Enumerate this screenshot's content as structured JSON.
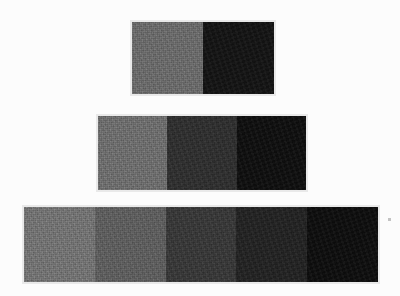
{
  "canvas": {
    "width": 400,
    "height": 296,
    "background": "#fcfcfc",
    "title": "Grayscale block pyramid"
  },
  "style": {
    "border_color": "#e9e9e9",
    "border_width": 2,
    "texture": "grainy-noise"
  },
  "chart_data": {
    "type": "heatmap",
    "subtitle": "",
    "xlabel": "",
    "ylabel": "",
    "grid": false,
    "legend": "none",
    "rows": [
      {
        "index": 0,
        "name": "top-row",
        "cell_count": 2,
        "x": 130,
        "y": 20,
        "width": 146,
        "height": 76,
        "cells": [
          {
            "index": 0,
            "color": "#6b6b6b",
            "gray_value": 107
          },
          {
            "index": 1,
            "color": "#131313",
            "gray_value": 19
          }
        ]
      },
      {
        "index": 1,
        "name": "middle-row",
        "cell_count": 3,
        "x": 96,
        "y": 114,
        "width": 212,
        "height": 78,
        "cells": [
          {
            "index": 0,
            "color": "#6e6e6e",
            "gray_value": 110
          },
          {
            "index": 1,
            "color": "#2e2e2e",
            "gray_value": 46
          },
          {
            "index": 2,
            "color": "#0e0e0e",
            "gray_value": 14
          }
        ]
      },
      {
        "index": 2,
        "name": "bottom-row",
        "cell_count": 5,
        "x": 22,
        "y": 205,
        "width": 358,
        "height": 79,
        "cells": [
          {
            "index": 0,
            "color": "#747474",
            "gray_value": 116
          },
          {
            "index": 1,
            "color": "#5e5e5e",
            "gray_value": 94
          },
          {
            "index": 2,
            "color": "#373737",
            "gray_value": 55
          },
          {
            "index": 3,
            "color": "#222222",
            "gray_value": 34
          },
          {
            "index": 4,
            "color": "#0d0d0d",
            "gray_value": 13
          }
        ]
      }
    ],
    "marks": [
      {
        "name": "margin-speck",
        "x": 388,
        "y": 218,
        "color": "#b9b9b9"
      }
    ]
  }
}
